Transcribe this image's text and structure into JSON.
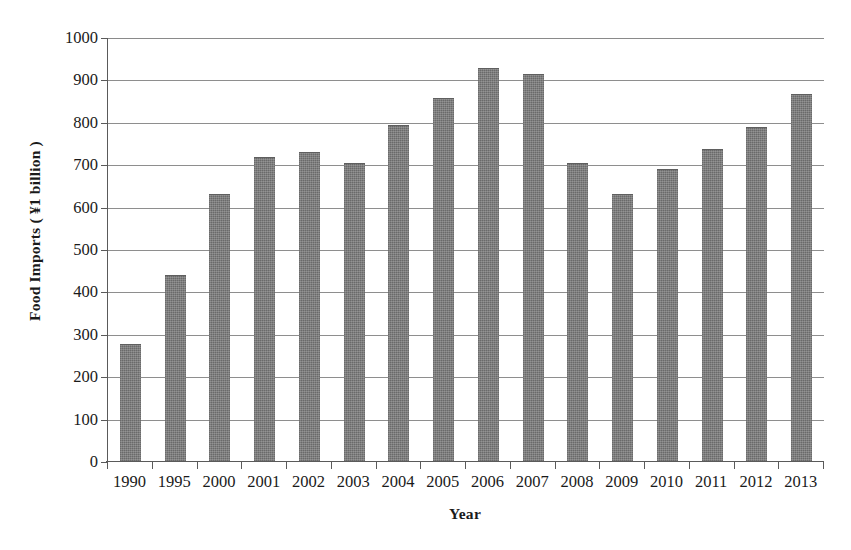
{
  "chart_data": {
    "type": "bar",
    "title": "",
    "xlabel": "Year",
    "ylabel": "Food Imports ( ¥1 billion )",
    "categories": [
      "1990",
      "1995",
      "2000",
      "2001",
      "2002",
      "2003",
      "2004",
      "2005",
      "2006",
      "2007",
      "2008",
      "2009",
      "2010",
      "2011",
      "2012",
      "2013"
    ],
    "values": [
      278,
      440,
      632,
      719,
      731,
      705,
      795,
      859,
      929,
      915,
      705,
      633,
      692,
      739,
      791,
      869
    ],
    "ylim": [
      0,
      1000
    ],
    "ytick_labels": [
      "1000",
      "900",
      "800",
      "700",
      "600",
      "500",
      "400",
      "300",
      "200",
      "100",
      "0"
    ],
    "ytick_values": [
      1000,
      900,
      800,
      700,
      600,
      500,
      400,
      300,
      200,
      100,
      0
    ],
    "grid": "horizontal",
    "legend": "none",
    "bar_color": "#767676",
    "axis_color": "#5a5a5a",
    "gridline_color": "#8e8e8e",
    "background_color": "#ffffff"
  }
}
